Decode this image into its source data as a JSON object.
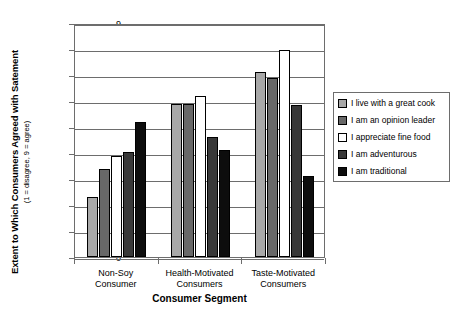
{
  "chart_data": {
    "type": "bar",
    "title": "",
    "xlabel": "Consumer Segment",
    "ylabel": "Extent to Which Consumers Agreed with Satement",
    "ylabel_sub": "(1 = disagree, 9 = agree)",
    "ylim": [
      0,
      9
    ],
    "yticks": [
      0,
      1,
      2,
      3,
      4,
      5,
      6,
      7,
      8,
      9
    ],
    "grid": true,
    "legend_position": "right",
    "categories": [
      "Non-Soy Consumer",
      "Health-Motivated Consumers",
      "Taste-Motivated Consumers"
    ],
    "category_lines": [
      [
        "Non-Soy",
        "Consumer"
      ],
      [
        "Health-Motivated",
        "Consumers"
      ],
      [
        "Taste-Motivated",
        "Consumers"
      ]
    ],
    "series": [
      {
        "name": "I live with a great cook",
        "color": "#a8a8a8",
        "values": [
          2.3,
          5.9,
          7.1
        ]
      },
      {
        "name": "I am an opinion leader",
        "color": "#686868",
        "values": [
          3.4,
          5.9,
          6.9
        ]
      },
      {
        "name": "I appreciate fine food",
        "color": "#ffffff",
        "values": [
          3.9,
          6.2,
          7.95
        ]
      },
      {
        "name": "I am adventurous",
        "color": "#383838",
        "values": [
          4.05,
          4.6,
          5.85
        ]
      },
      {
        "name": "I am traditional",
        "color": "#0d0d0d",
        "values": [
          5.2,
          4.1,
          3.1
        ]
      }
    ]
  },
  "colors": {
    "axis": "#6d6d6d",
    "border": "#000000",
    "background": "#ffffff"
  }
}
